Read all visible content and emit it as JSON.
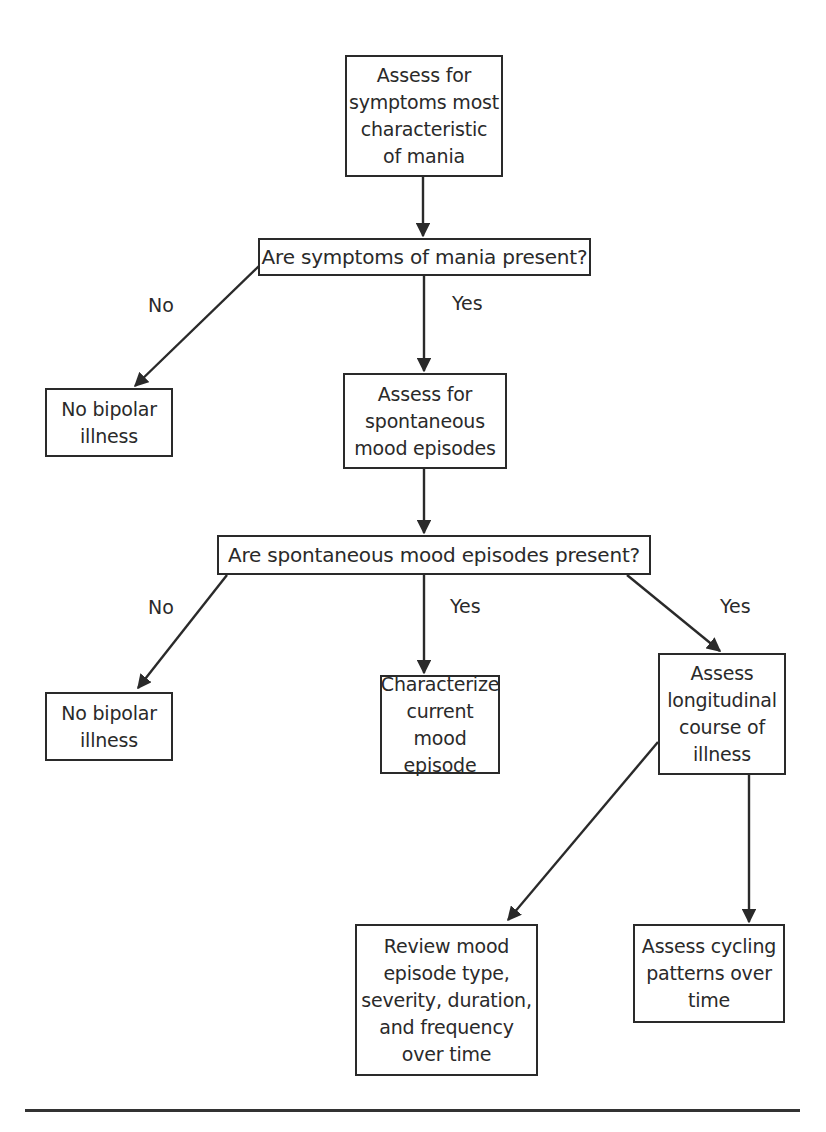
{
  "diagram": {
    "type": "flowchart",
    "nodes": {
      "assess_mania": {
        "text": "Assess for\nsymptoms most\ncharacteristic\nof mania"
      },
      "q_mania": {
        "text": "Are symptoms of mania present?"
      },
      "no_bipolar_1": {
        "text": "No bipolar\nillness"
      },
      "assess_spontaneous": {
        "text": "Assess for\nspontaneous\nmood episodes"
      },
      "q_spontaneous": {
        "text": "Are spontaneous mood episodes present?"
      },
      "no_bipolar_2": {
        "text": "No bipolar\nillness"
      },
      "characterize": {
        "text": "Characterize\ncurrent mood\nepisode"
      },
      "longitudinal": {
        "text": "Assess\nlongitudinal\ncourse of\nillness"
      },
      "review": {
        "text": "Review mood\nepisode type,\nseverity, duration,\nand frequency\nover time"
      },
      "cycling": {
        "text": "Assess cycling\npatterns over\ntime"
      }
    },
    "edge_labels": {
      "q_mania_no": "No",
      "q_mania_yes": "Yes",
      "q_spont_no": "No",
      "q_spont_yes_center": "Yes",
      "q_spont_yes_right": "Yes"
    },
    "edges": [
      {
        "from": "assess_mania",
        "to": "q_mania",
        "label": ""
      },
      {
        "from": "q_mania",
        "to": "no_bipolar_1",
        "label": "No"
      },
      {
        "from": "q_mania",
        "to": "assess_spontaneous",
        "label": "Yes"
      },
      {
        "from": "assess_spontaneous",
        "to": "q_spontaneous",
        "label": ""
      },
      {
        "from": "q_spontaneous",
        "to": "no_bipolar_2",
        "label": "No"
      },
      {
        "from": "q_spontaneous",
        "to": "characterize",
        "label": "Yes"
      },
      {
        "from": "q_spontaneous",
        "to": "longitudinal",
        "label": "Yes"
      },
      {
        "from": "longitudinal",
        "to": "review",
        "label": ""
      },
      {
        "from": "longitudinal",
        "to": "cycling",
        "label": ""
      }
    ],
    "colors": {
      "stroke": "#2a2a2a",
      "background": "#ffffff"
    }
  }
}
